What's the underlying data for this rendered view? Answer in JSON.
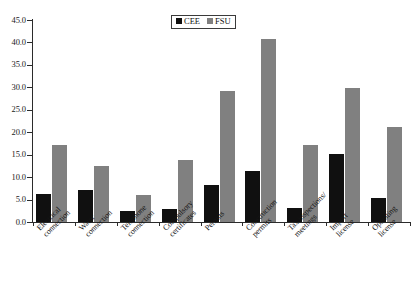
{
  "chart_data": {
    "type": "bar",
    "title": "",
    "subtitle": "",
    "xlabel": "",
    "ylabel": "",
    "ylim": [
      0.0,
      45.0
    ],
    "ytick_step": 5.0,
    "ytick_labels": [
      "45.0",
      "40.0",
      "35.0",
      "30.0",
      "25.0",
      "20.0",
      "15.0",
      "10.0",
      "5.0",
      "0.0"
    ],
    "ytick_values": [
      45.0,
      40.0,
      35.0,
      30.0,
      25.0,
      20.0,
      15.0,
      10.0,
      5.0,
      0.0
    ],
    "grid": false,
    "legend_position": "top-center",
    "categories": [
      "Electrical connection",
      "Water connection",
      "Telephone connection",
      "Compulsory certificates",
      "Permits",
      "Construction permits",
      "Tax inspections/ meetings",
      "Import license",
      "Operating license"
    ],
    "category_lines": [
      [
        "Electrical",
        "connection"
      ],
      [
        "Water",
        "connection"
      ],
      [
        "Telephone",
        "connection"
      ],
      [
        "Compulsory",
        "certificates"
      ],
      [
        "Permits",
        ""
      ],
      [
        "Construction",
        "permits"
      ],
      [
        "Tax inspections/",
        "meetings"
      ],
      [
        "Import",
        "license"
      ],
      [
        "Operating",
        "license"
      ]
    ],
    "series": [
      {
        "name": "CEE",
        "color": "#101010",
        "values": [
          6.2,
          7.2,
          2.4,
          3.0,
          8.3,
          11.3,
          3.2,
          15.1,
          5.3
        ]
      },
      {
        "name": "FSU",
        "color": "#808080",
        "values": [
          17.1,
          12.5,
          6.0,
          13.9,
          29.2,
          40.7,
          17.2,
          29.8,
          21.2
        ]
      }
    ]
  },
  "legend": {
    "entries": [
      {
        "label": "CEE",
        "color": "#101010"
      },
      {
        "label": "FSU",
        "color": "#808080"
      }
    ]
  }
}
